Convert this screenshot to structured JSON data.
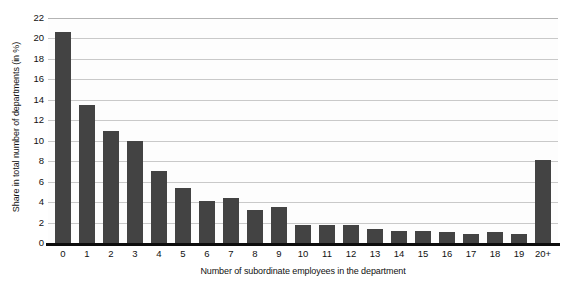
{
  "chart_data": {
    "type": "bar",
    "title": "",
    "xlabel": "Number of subordinate employees in the department",
    "ylabel": "Share in total number of departments (in %)",
    "categories": [
      "0",
      "1",
      "2",
      "3",
      "4",
      "5",
      "6",
      "7",
      "8",
      "9",
      "10",
      "11",
      "12",
      "13",
      "14",
      "15",
      "16",
      "17",
      "18",
      "19",
      "20+"
    ],
    "values": [
      20.6,
      13.5,
      11.0,
      10.0,
      7.0,
      5.4,
      4.1,
      4.4,
      3.2,
      3.5,
      1.8,
      1.8,
      1.8,
      1.4,
      1.2,
      1.2,
      1.1,
      0.9,
      1.1,
      0.9,
      8.1
    ],
    "ylim": [
      0,
      22
    ],
    "ytick_values": [
      0,
      2,
      4,
      6,
      8,
      10,
      12,
      14,
      16,
      18,
      20,
      22
    ],
    "ytick_labels": [
      "0",
      "2",
      "4",
      "6",
      "8",
      "10",
      "12",
      "14",
      "16",
      "18",
      "20",
      "22"
    ],
    "grid": true,
    "grid_axis": "y",
    "legend": false,
    "bar_color": "#434343",
    "grid_color": "#c9c9c9",
    "axis_color": "#0d0d0d",
    "background_color": "#ffffff"
  }
}
